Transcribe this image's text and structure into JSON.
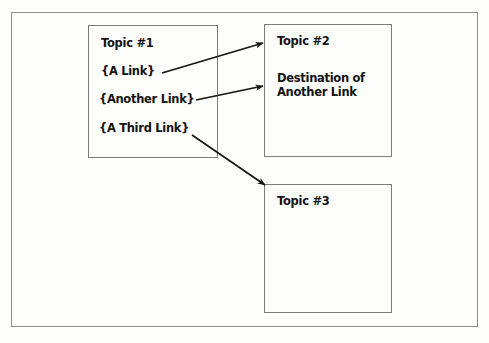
{
  "diagram": {
    "frame": {
      "name": "outer-frame"
    },
    "boxes": [
      {
        "id": "topic1",
        "title": "Topic #1",
        "links": [
          {
            "id": "link1",
            "label": "{A Link}"
          },
          {
            "id": "link2",
            "label": "{Another Link}"
          },
          {
            "id": "link3",
            "label": "{A Third Link}"
          }
        ]
      },
      {
        "id": "topic2",
        "title": "Topic #2",
        "destination_line1": "Destination of",
        "destination_line2": "Another Link"
      },
      {
        "id": "topic3",
        "title": "Topic #3"
      }
    ],
    "arrows": [
      {
        "id": "arrow-a-link-to-topic2",
        "from": "{A Link}",
        "to": "Topic #2",
        "x1": 162,
        "y1": 73,
        "x2": 263,
        "y2": 43
      },
      {
        "id": "arrow-another-link-to-topic2",
        "from": "{Another Link}",
        "to": "Destination of Another Link",
        "x1": 196,
        "y1": 100,
        "x2": 263,
        "y2": 86
      },
      {
        "id": "arrow-third-link-to-topic3",
        "from": "{A Third Link}",
        "to": "Topic #3",
        "x1": 192,
        "y1": 135,
        "x2": 265,
        "y2": 185
      }
    ],
    "colors": {
      "ink": "#131313",
      "box_border": "#7c7c7c",
      "frame_border": "#8d8d8d",
      "arrow": "#161616",
      "background": "#ffffff"
    }
  }
}
